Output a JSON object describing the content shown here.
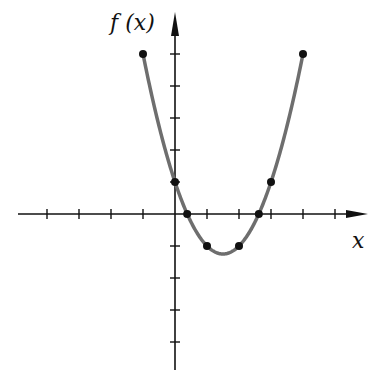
{
  "chart_data": {
    "type": "line",
    "title": "",
    "function": "f(x) = x^2 - 3x + 1",
    "xlabel": "x",
    "ylabel": "f (x)",
    "x_ticks": [
      -4,
      -3,
      -2,
      -1,
      1,
      2,
      3,
      4,
      5
    ],
    "y_ticks": [
      -4,
      -3,
      -2,
      -1,
      1,
      2,
      3,
      4,
      5
    ],
    "xlim": [
      -4.8,
      5.8
    ],
    "ylim": [
      -4.9,
      6.7
    ],
    "grid": false,
    "series": [
      {
        "name": "f(x)",
        "x": [
          -1,
          0,
          0.38,
          1,
          2,
          2.62,
          3,
          4
        ],
        "y": [
          5,
          1,
          0,
          -1,
          -1,
          0,
          1,
          5
        ]
      }
    ],
    "curve_domain": [
      -1,
      4
    ],
    "colors": {
      "curve": "#6e6e6e",
      "axes": "#111111",
      "points": "#111111"
    }
  },
  "labels": {
    "y_axis": "f (x)",
    "x_axis": "x"
  }
}
